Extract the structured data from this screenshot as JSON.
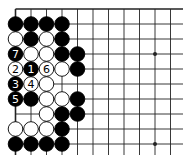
{
  "board": {
    "size": 19,
    "region": "top-left corner",
    "visible_cols": 12,
    "visible_rows": 10,
    "origin_x": 15.5,
    "origin_y": 9,
    "col_spacing": 15.5,
    "row_spacing": 15,
    "line_right_x": 183,
    "line_bottom_y": 155,
    "stone_radius": 7.3,
    "colors": {
      "background": "#ffffff",
      "line": "#222222",
      "black_stone": "#000000",
      "white_stone": "#ffffff",
      "stone_outline": "#000000",
      "label_on_black": "#ffffff",
      "label_on_white": "#000000"
    },
    "star_points": [
      {
        "col": 3,
        "row": 3
      },
      {
        "col": 9,
        "row": 3
      },
      {
        "col": 3,
        "row": 9
      },
      {
        "col": 9,
        "row": 9
      }
    ],
    "stones": [
      {
        "col": 0,
        "row": 1,
        "color": "black"
      },
      {
        "col": 1,
        "row": 1,
        "color": "black"
      },
      {
        "col": 2,
        "row": 1,
        "color": "black"
      },
      {
        "col": 3,
        "row": 1,
        "color": "black"
      },
      {
        "col": 0,
        "row": 2,
        "color": "white"
      },
      {
        "col": 1,
        "row": 2,
        "color": "black"
      },
      {
        "col": 2,
        "row": 2,
        "color": "white"
      },
      {
        "col": 3,
        "row": 2,
        "color": "black"
      },
      {
        "col": 0,
        "row": 3,
        "color": "black",
        "label": "7"
      },
      {
        "col": 1,
        "row": 3,
        "color": "white"
      },
      {
        "col": 2,
        "row": 3,
        "color": "white"
      },
      {
        "col": 3,
        "row": 3,
        "color": "black"
      },
      {
        "col": 4,
        "row": 3,
        "color": "black"
      },
      {
        "col": 0,
        "row": 4,
        "color": "white",
        "label": "2"
      },
      {
        "col": 1,
        "row": 4,
        "color": "black",
        "label": "1"
      },
      {
        "col": 2,
        "row": 4,
        "color": "white",
        "label": "6"
      },
      {
        "col": 3,
        "row": 4,
        "color": "white"
      },
      {
        "col": 4,
        "row": 4,
        "color": "black"
      },
      {
        "col": 0,
        "row": 5,
        "color": "black",
        "label": "3"
      },
      {
        "col": 1,
        "row": 5,
        "color": "white",
        "label": "4"
      },
      {
        "col": 2,
        "row": 5,
        "color": "white"
      },
      {
        "col": 0,
        "row": 6,
        "color": "black",
        "label": "5"
      },
      {
        "col": 1,
        "row": 6,
        "color": "black"
      },
      {
        "col": 2,
        "row": 6,
        "color": "white"
      },
      {
        "col": 3,
        "row": 6,
        "color": "white"
      },
      {
        "col": 4,
        "row": 6,
        "color": "black"
      },
      {
        "col": 2,
        "row": 7,
        "color": "white"
      },
      {
        "col": 3,
        "row": 7,
        "color": "black"
      },
      {
        "col": 4,
        "row": 7,
        "color": "black"
      },
      {
        "col": 0,
        "row": 8,
        "color": "white"
      },
      {
        "col": 1,
        "row": 8,
        "color": "white"
      },
      {
        "col": 2,
        "row": 8,
        "color": "white"
      },
      {
        "col": 3,
        "row": 8,
        "color": "black"
      },
      {
        "col": 0,
        "row": 9,
        "color": "black"
      },
      {
        "col": 1,
        "row": 9,
        "color": "black"
      },
      {
        "col": 2,
        "row": 9,
        "color": "black"
      },
      {
        "col": 3,
        "row": 9,
        "color": "black"
      }
    ]
  }
}
